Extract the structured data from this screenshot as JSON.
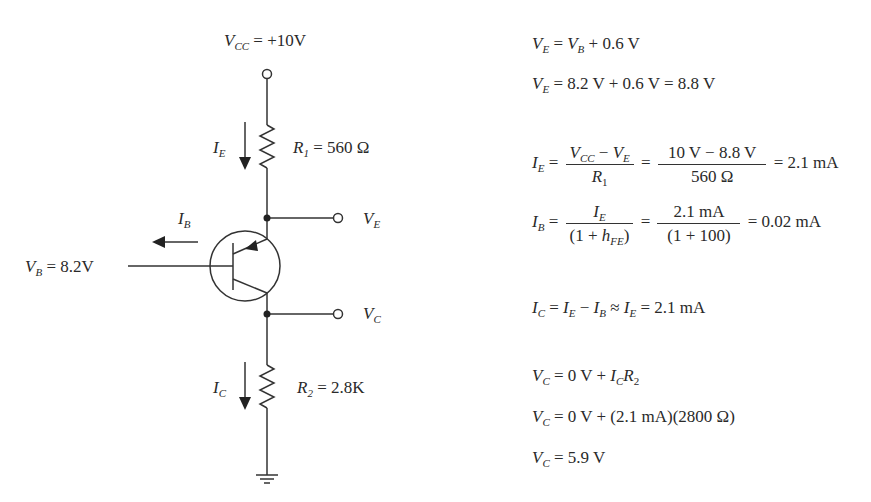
{
  "circuit": {
    "vcc_label": {
      "symbol": "V",
      "sub": "CC",
      "value": " = +10V"
    },
    "r1_label": {
      "symbol": "R",
      "sub": "1",
      "value": " = 560 Ω"
    },
    "r2_label": {
      "symbol": "R",
      "sub": "2",
      "value": " = 2.8K"
    },
    "ie_label": {
      "symbol": "I",
      "sub": "E"
    },
    "ib_label": {
      "symbol": "I",
      "sub": "B"
    },
    "ic_label": {
      "symbol": "I",
      "sub": "C"
    },
    "ve_label": {
      "symbol": "V",
      "sub": "E"
    },
    "vc_label": {
      "symbol": "V",
      "sub": "C"
    },
    "vb_label": {
      "symbol": "V",
      "sub": "B",
      "value": " = 8.2V"
    },
    "transistor_type": "PNP",
    "icons": [
      "terminal-icon",
      "resistor-icon",
      "pnp-transistor-icon",
      "ground-icon",
      "current-arrow-icon",
      "junction-dot-icon"
    ]
  },
  "equations": {
    "eq1": {
      "lhs": "V",
      "lhs_sub": "E",
      "rhs_a": " = ",
      "rhs_sym": "V",
      "rhs_sub": "B",
      "rhs_b": " + 0.6 V"
    },
    "eq2": {
      "lhs": "V",
      "lhs_sub": "E",
      "rhs": " = 8.2 V + 0.6 V = 8.8 V"
    },
    "eq3": {
      "lhs": "I",
      "lhs_sub": "E",
      "frac1_num_a": "V",
      "frac1_num_a_sub": "CC",
      "frac1_num_b": " − ",
      "frac1_num_c": "V",
      "frac1_num_c_sub": "E",
      "frac1_den": "R",
      "frac1_den_sub": "1",
      "frac2_num": "10 V − 8.8 V",
      "frac2_den": "560 Ω",
      "result": "= 2.1 mA"
    },
    "eq4": {
      "lhs": "I",
      "lhs_sub": "B",
      "frac1_num": "I",
      "frac1_num_sub": "E",
      "frac1_den_a": "(1 + ",
      "frac1_den_h": "h",
      "frac1_den_sub": "FE",
      "frac1_den_b": ")",
      "frac2_num": "2.1 mA",
      "frac2_den": "(1 + 100)",
      "result": "= 0.02 mA"
    },
    "eq5": {
      "lhs": "I",
      "lhs_sub": "C",
      "t1": " = ",
      "s1": "I",
      "s1_sub": "E",
      "t2": " − ",
      "s2": "I",
      "s2_sub": "B",
      "t3": " ≈ ",
      "s3": "I",
      "s3_sub": "E",
      "t4": " = 2.1 mA"
    },
    "eq6": {
      "lhs": "V",
      "lhs_sub": "C",
      "t1": " = 0 V + ",
      "s1": "I",
      "s1_sub": "C",
      "s2": "R",
      "s2_sub": "2"
    },
    "eq7": {
      "lhs": "V",
      "lhs_sub": "C",
      "rhs": " = 0 V + (2.1 mA)(2800 Ω)"
    },
    "eq8": {
      "lhs": "V",
      "lhs_sub": "C",
      "rhs": " = 5.9 V"
    }
  }
}
